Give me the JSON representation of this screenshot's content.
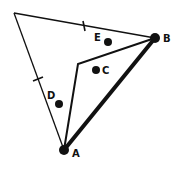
{
  "diagram": {
    "title": "",
    "stroke_color": "#111111",
    "vertices": {
      "top": {
        "x": 14,
        "y": 13
      },
      "A": {
        "x": 64,
        "y": 150
      },
      "B": {
        "x": 155,
        "y": 38
      },
      "inner": {
        "x": 78,
        "y": 64
      }
    },
    "points": [
      {
        "name": "A",
        "label": "A",
        "x": 64,
        "y": 150,
        "r": 5,
        "label_x": 72,
        "label_y": 157
      },
      {
        "name": "B",
        "label": "B",
        "x": 155,
        "y": 38,
        "r": 5,
        "label_x": 164,
        "label_y": 42
      },
      {
        "name": "C",
        "label": "C",
        "x": 96,
        "y": 70,
        "r": 4,
        "label_x": 103,
        "label_y": 74
      },
      {
        "name": "D",
        "label": "D",
        "x": 59,
        "y": 104,
        "r": 4,
        "label_x": 47,
        "label_y": 99
      },
      {
        "name": "E",
        "label": "E",
        "x": 108,
        "y": 42,
        "r": 4,
        "label_x": 94,
        "label_y": 41
      }
    ],
    "tick_marks": [
      {
        "edge": "top-to-B",
        "x": 84,
        "y": 26
      },
      {
        "edge": "top-to-A",
        "x": 38,
        "y": 79
      }
    ]
  }
}
